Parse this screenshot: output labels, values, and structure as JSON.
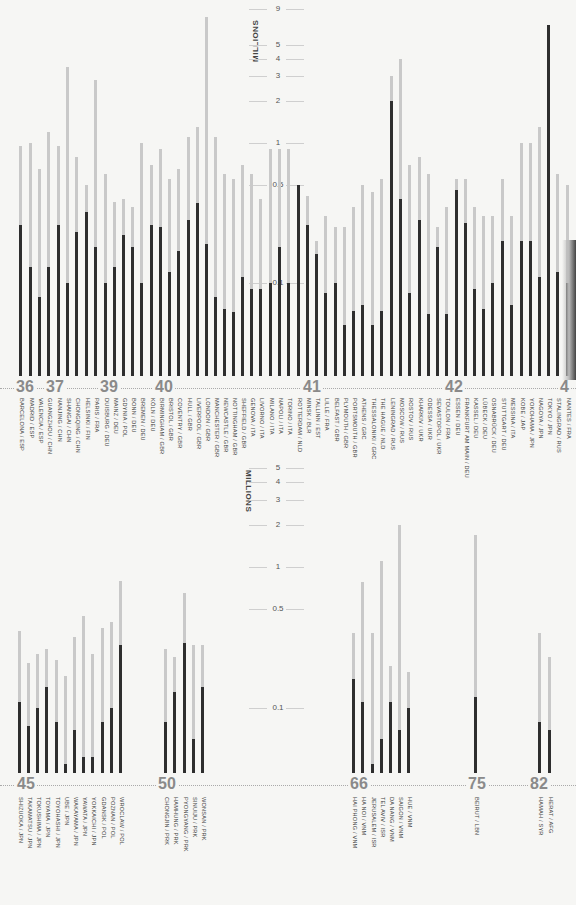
{
  "chart_data": [
    {
      "type": "bar",
      "title": "",
      "ylabel": "MILLIONS",
      "yscale": "log",
      "yticks": [
        0.1,
        0.5,
        1,
        2,
        3,
        4,
        5,
        9
      ],
      "ytick_labels": [
        "0.1",
        "0.5",
        "1",
        "2",
        "3",
        "4",
        "5",
        "9"
      ],
      "legend": [],
      "series_meaning": {
        "light": "population before (peak)",
        "dark": "population after (low)"
      },
      "year_markers": [
        {
          "label": "36",
          "x": 26
        },
        {
          "label": "37",
          "x": 56
        },
        {
          "label": "39",
          "x": 110
        },
        {
          "label": "40",
          "x": 165
        },
        {
          "label": "41",
          "x": 313
        },
        {
          "label": "42",
          "x": 455
        },
        {
          "label": "4",
          "x": 570
        }
      ],
      "categories": [
        "BARCELONA / ESP",
        "MADRID / ESP",
        "VALENCIA / ESP",
        "GUANGZHOU / CHN",
        "NANJING / CHN",
        "SHANGAI / CHN",
        "CHONGQING / CHN",
        "HELSINKI / FIN",
        "PARIS / FRA",
        "DUISBURG / DEU",
        "MAINZ / DEU",
        "GDYNIA / POL",
        "BONN / DEU",
        "BREMEN / DEU",
        "KÖLN / DEU",
        "BIRMINGHAM / GBR",
        "BRISTOL / GBR",
        "COVENTRY / GBR",
        "HULL / GBR",
        "LIVERPOOL / GBR",
        "LONDON / GBR",
        "MANCHESTER / GBR",
        "NEWCASTLE / GBR",
        "NOTTINGHAM / GBR",
        "SHEFFIELD / GBR",
        "GENOVA / ITA",
        "LIVORNO / ITA",
        "MILANO / ITA",
        "NAPOLI / ITA",
        "TORINO / ITA",
        "ROTTERDAM / NLD",
        "MINSK / BLR",
        "TALLINN / EST",
        "LILLE / FRA",
        "BELFAST / GBR",
        "PLYMOUTH / GBR",
        "PORTSMOUTH / GBR",
        "ATHENS / GRC",
        "THESSALONIKI / GRC",
        "THE HAGUE / NLD",
        "LENINGRAD / RUS",
        "MOSCOW / RUS",
        "ROSTOV / RUS",
        "KHARKIV / UKR",
        "ODESSA / UKR",
        "SEVASTOPOL / UKR",
        "TOULON / FRA",
        "ESSEN / DEU",
        "FRANKFURT AM MAIN / DEU",
        "KASSEL / DEU",
        "LÜBECK / DEU",
        "OSNABRÜCK / DEU",
        "STUTTGART / DEU",
        "MESSINA / ITA",
        "KOBE / JAP",
        "YOKOHAMA / JPN",
        "NAGOYA / JPN",
        "TOKYO / JPN",
        "STALINGRAD / RUS",
        "NANTES / FRA"
      ],
      "x_px": [
        19,
        29,
        38,
        47,
        57,
        66,
        75,
        85,
        94,
        104,
        113,
        122,
        131,
        140,
        150,
        159,
        168,
        177,
        187,
        196,
        205,
        214,
        223,
        232,
        241,
        250,
        259,
        269,
        278,
        287,
        297,
        306,
        315,
        324,
        334,
        343,
        352,
        361,
        371,
        380,
        390,
        399,
        408,
        418,
        427,
        436,
        445,
        455,
        464,
        473,
        482,
        491,
        501,
        510,
        520,
        529,
        538,
        547,
        556,
        566
      ],
      "series": [
        {
          "name": "light",
          "values": [
            0.95,
            1.0,
            0.65,
            1.2,
            0.95,
            3.5,
            0.8,
            0.5,
            2.8,
            0.6,
            0.38,
            0.4,
            0.35,
            1.0,
            0.7,
            0.9,
            0.55,
            0.65,
            1.1,
            1.3,
            8.0,
            1.1,
            0.6,
            0.55,
            0.7,
            0.6,
            0.4,
            0.9,
            0.9,
            0.9,
            0.5,
            0.42,
            0.2,
            0.3,
            0.25,
            0.25,
            0.35,
            0.5,
            0.45,
            0.55,
            3.0,
            4.0,
            0.7,
            0.8,
            0.6,
            0.25,
            0.35,
            0.55,
            0.55,
            0.35,
            0.3,
            0.3,
            0.55,
            0.3,
            1.0,
            1.0,
            1.3,
            7.0,
            0.6,
            0.5
          ]
        },
        {
          "name": "dark",
          "values": [
            0.26,
            0.13,
            0.08,
            0.13,
            0.26,
            0.1,
            0.23,
            0.32,
            0.18,
            0.1,
            0.13,
            0.22,
            0.18,
            0.1,
            0.26,
            0.25,
            0.12,
            0.17,
            0.28,
            0.37,
            0.19,
            0.08,
            0.065,
            0.062,
            0.11,
            0.09,
            0.09,
            0.1,
            0.18,
            0.1,
            0.5,
            0.26,
            0.16,
            0.085,
            0.1,
            0.05,
            0.063,
            0.07,
            0.05,
            0.063,
            2.0,
            0.4,
            0.085,
            0.28,
            0.06,
            0.18,
            0.06,
            0.46,
            0.27,
            0.09,
            0.065,
            0.1,
            0.2,
            0.07,
            0.2,
            0.2,
            0.11,
            7.0,
            0.12,
            0.1
          ]
        }
      ],
      "ylim": [
        0.04,
        10
      ]
    },
    {
      "type": "bar",
      "title": "",
      "ylabel": "MILLIONS",
      "yscale": "log",
      "yticks": [
        0.1,
        0.5,
        1,
        2,
        3,
        4,
        5
      ],
      "ytick_labels": [
        "0.1",
        "0.5",
        "1",
        "2",
        "3",
        "4",
        "5"
      ],
      "year_markers": [
        {
          "label": "45",
          "x": 27
        },
        {
          "label": "50",
          "x": 168
        },
        {
          "label": "66",
          "x": 360
        },
        {
          "label": "75",
          "x": 478
        },
        {
          "label": "82",
          "x": 540
        }
      ],
      "categories": [
        "SHIZUOKA / JPN",
        "TAKAMATSU / JPN",
        "TOKUSHIMA / JPN",
        "TOYAMA / JPN",
        "TOYOHASHI / JPN",
        "UBE / JPN",
        "WAKAYAMA / JPN",
        "YAWATA / JPN",
        "YOKKAICHI / JPN",
        "GDANSK / POL",
        "POZNAN / POL",
        "WROCLAW / POL",
        "CHONGJIN / PRK",
        "HAMHUNG / PRK",
        "PYONGYANG / PRK",
        "SINUIJU / PRK",
        "WONSAN / PRK",
        "HAI PHONG / VNM",
        "HA NOI / VNM",
        "JERUSALEM / ISR",
        "TEL AVIV / ISR",
        "DA NANG / VNM",
        "SAIGON / VNM",
        "HUE / VNM",
        "BEIRUT / LBN",
        "HAMAH / SYR",
        "HERAT / AFG"
      ],
      "x_px": [
        18,
        27,
        36,
        45,
        55,
        64,
        73,
        82,
        91,
        101,
        110,
        119,
        164,
        173,
        183,
        192,
        201,
        352,
        361,
        371,
        380,
        389,
        398,
        407,
        474,
        538,
        548
      ],
      "series": [
        {
          "name": "light",
          "values": [
            0.35,
            0.21,
            0.24,
            0.26,
            0.22,
            0.17,
            0.32,
            0.45,
            0.24,
            0.37,
            0.41,
            0.8,
            0.26,
            0.23,
            0.65,
            0.28,
            0.28,
            0.34,
            0.78,
            0.34,
            1.1,
            0.2,
            2.0,
            0.18,
            1.7,
            0.34,
            0.23
          ]
        },
        {
          "name": "dark",
          "values": [
            0.11,
            0.075,
            0.1,
            0.14,
            0.08,
            0.04,
            0.07,
            0.045,
            0.045,
            0.08,
            0.1,
            0.28,
            0.08,
            0.13,
            0.29,
            0.06,
            0.14,
            0.16,
            0.11,
            0.04,
            0.06,
            0.11,
            0.07,
            0.1,
            0.12,
            0.08,
            0.07
          ]
        }
      ],
      "ylim": [
        0.035,
        6
      ]
    }
  ],
  "charts": {
    "top": {
      "unit_label": "MILLIONS"
    },
    "bottom": {
      "unit_label": "MILLIONS"
    }
  }
}
